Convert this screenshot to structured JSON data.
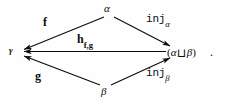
{
  "diagram": {
    "type": "commutative-diagram",
    "background_color": "#fefefe",
    "ink_color": "#0c0c0c",
    "nodes": [
      {
        "id": "alpha",
        "label": "α",
        "x": 108,
        "y": 10
      },
      {
        "id": "gamma",
        "label": "γ",
        "x": 12,
        "y": 51
      },
      {
        "id": "coprod",
        "label": "(α⊔β)",
        "left": "(",
        "alpha": "α",
        "sym": "⊔",
        "beta": "β",
        "right": ")",
        "x": 180,
        "y": 52
      },
      {
        "id": "beta",
        "label": "β",
        "x": 104,
        "y": 91
      }
    ],
    "edges": [
      {
        "id": "f",
        "from": "alpha",
        "to": "gamma",
        "label": "f",
        "label_x": 43,
        "label_y": 18
      },
      {
        "id": "inj_a",
        "from": "alpha",
        "to": "coprod",
        "label": "inj",
        "subscript": "α",
        "label_x": 146,
        "label_y": 16
      },
      {
        "id": "h_fg",
        "from": "coprod",
        "to": "gamma",
        "label": "h",
        "subscript": "f,g",
        "label_x": 77,
        "label_y": 35
      },
      {
        "id": "g",
        "from": "beta",
        "to": "gamma",
        "label": "g",
        "label_x": 35,
        "label_y": 72
      },
      {
        "id": "inj_b",
        "from": "beta",
        "to": "coprod",
        "label": "inj",
        "subscript": "β",
        "label_x": 146,
        "label_y": 70
      }
    ],
    "trailing_punctuation": "."
  }
}
